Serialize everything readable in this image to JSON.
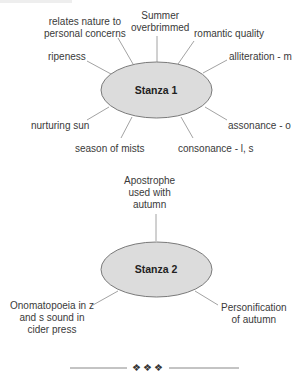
{
  "diagram_1": {
    "center": "Stanza 1",
    "branches": [
      {
        "label": "relates nature to\npersonal concerns",
        "line1": "relates nature to",
        "line2": "personal concerns"
      },
      {
        "label": "Summer overbrimmed",
        "line1": "Summer",
        "line2": "overbrimmed"
      },
      {
        "label": "romantic quality"
      },
      {
        "label": "ripeness"
      },
      {
        "label": "alliteration - m"
      },
      {
        "label": "nurturing sun"
      },
      {
        "label": "assonance - o"
      },
      {
        "label": "season of mists"
      },
      {
        "label": "consonance - l, s"
      }
    ]
  },
  "diagram_2": {
    "center": "Stanza 2",
    "branches": [
      {
        "label": "Apostrophe used with autumn",
        "line1": "Apostrophe",
        "line2": "used with",
        "line3": "autumn"
      },
      {
        "label": "Onomatopoeia in z and s sound in cider press",
        "line1": "Onomatopoeia in z",
        "line2": "and s sound in",
        "line3": "cider press"
      },
      {
        "label": "Personification of autumn",
        "line1": "Personification",
        "line2": "of autumn"
      }
    ]
  },
  "divider": {
    "ornament": "❖❖❖"
  },
  "colors": {
    "ellipse_fill": "#dcdcdc",
    "ellipse_stroke": "#7a7a7a",
    "line": "#8a8a8a",
    "text": "#3a3a3a"
  }
}
